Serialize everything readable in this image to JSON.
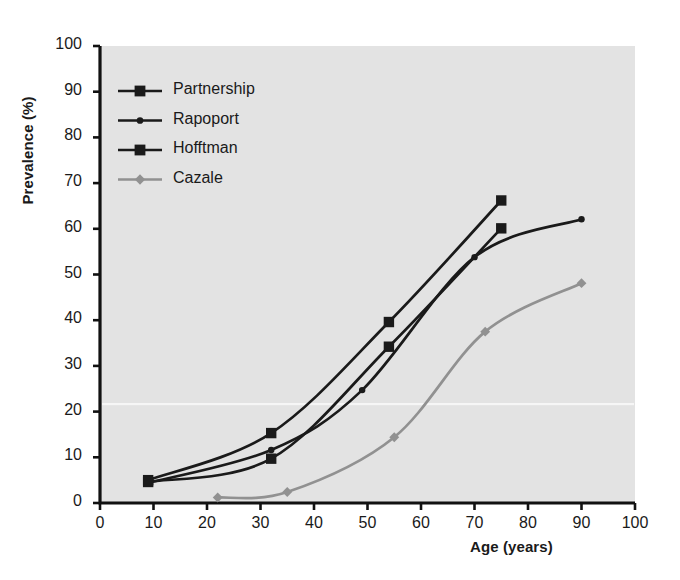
{
  "chart_data": {
    "type": "line",
    "title": "",
    "xlabel": "Age (years)",
    "ylabel": "Prevalence (%)",
    "xlim": [
      0,
      100
    ],
    "ylim": [
      0,
      100
    ],
    "xticks": [
      0,
      10,
      20,
      30,
      40,
      50,
      60,
      70,
      80,
      90,
      100
    ],
    "yticks": [
      0,
      10,
      20,
      30,
      40,
      50,
      60,
      70,
      80,
      90,
      100
    ],
    "grid": false,
    "legend_position": "top-left inside plot area",
    "plot_background": "#e3e3e3",
    "series": [
      {
        "name": "Partnership",
        "marker": "square",
        "color": "#1a1a1a",
        "points": [
          {
            "x": 9,
            "y": 5
          },
          {
            "x": 32,
            "y": 15.3
          },
          {
            "x": 54,
            "y": 39.6
          },
          {
            "x": 75,
            "y": 66.2
          }
        ]
      },
      {
        "name": "Rapoport",
        "marker": "circle",
        "color": "#1a1a1a",
        "points": [
          {
            "x": 9,
            "y": 4.4
          },
          {
            "x": 32,
            "y": 11.6
          },
          {
            "x": 49,
            "y": 24.7
          },
          {
            "x": 70,
            "y": 53.8
          },
          {
            "x": 90,
            "y": 62.1
          }
        ]
      },
      {
        "name": "Hofftman",
        "marker": "square",
        "color": "#1a1a1a",
        "points": [
          {
            "x": 9,
            "y": 4.6
          },
          {
            "x": 32,
            "y": 9.7
          },
          {
            "x": 54,
            "y": 34.2
          },
          {
            "x": 75,
            "y": 60.1
          }
        ]
      },
      {
        "name": "Cazale",
        "marker": "diamond",
        "color": "#919191",
        "points": [
          {
            "x": 22,
            "y": 1.2
          },
          {
            "x": 35,
            "y": 2.4
          },
          {
            "x": 55,
            "y": 14.4
          },
          {
            "x": 72,
            "y": 37.5
          },
          {
            "x": 90,
            "y": 48.1
          }
        ]
      }
    ]
  },
  "legend": {
    "items": [
      {
        "label": "Partnership",
        "marker": "square",
        "color": "#1a1a1a"
      },
      {
        "label": "Rapoport",
        "marker": "circle",
        "color": "#1a1a1a"
      },
      {
        "label": "Hofftman",
        "marker": "square",
        "color": "#1a1a1a"
      },
      {
        "label": "Cazale",
        "marker": "diamond",
        "color": "#919191"
      }
    ]
  },
  "colors": {
    "axis": "#111111",
    "plot_bg": "#e3e3e3",
    "series_dark": "#1a1a1a",
    "series_gray": "#919191",
    "page_bg": "#ffffff"
  }
}
